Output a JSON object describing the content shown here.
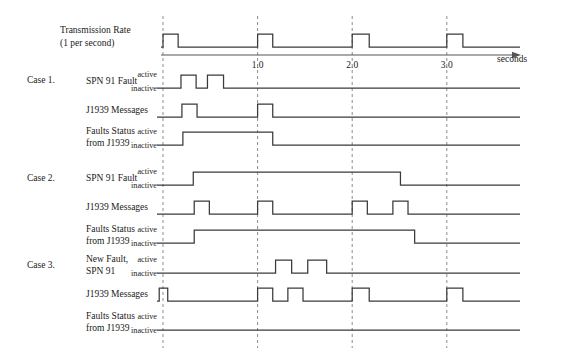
{
  "figure": {
    "title_row": {
      "label_line1": "Transmission Rate",
      "label_line2": "(1 per second)"
    },
    "axis": {
      "unit_label": "seconds",
      "tick_labels": [
        "1.0",
        "2.0",
        "3.0"
      ],
      "tick_times": [
        1.0,
        2.0,
        3.0
      ],
      "time_min": 0.0,
      "time_max": 4.1,
      "gridline_times": [
        0.0,
        1.0,
        2.0,
        3.0
      ]
    },
    "state_labels": {
      "high": "active",
      "low": "inactive"
    },
    "colors": {
      "waveform": "#3a3a3a",
      "gridline": "#8c8c8c",
      "axis": "#555555",
      "text": "#1a1a1a",
      "background": "#ffffff"
    },
    "cases": [
      {
        "case_label": "Case 1.",
        "rows": [
          {
            "label_line1": "SPN 91 Fault",
            "label_line2": "",
            "show_state_labels": true,
            "pulses": [
              [
                0.19,
                0.35
              ],
              [
                0.47,
                0.64
              ]
            ],
            "level_start": 0
          },
          {
            "label_line1": "J1939 Messages",
            "label_line2": "",
            "show_state_labels": false,
            "pulses": [
              [
                0.2,
                0.36
              ],
              [
                1.0,
                1.16
              ]
            ],
            "level_start": 0
          },
          {
            "label_line1": "Faults Status",
            "label_line2": "from J1939",
            "show_state_labels": true,
            "pulses": [
              [
                0.21,
                1.16
              ]
            ],
            "level_start": 0
          }
        ]
      },
      {
        "case_label": "Case 2.",
        "rows": [
          {
            "label_line1": "SPN 91 Fault",
            "label_line2": "",
            "show_state_labels": true,
            "pulses": [
              [
                0.32,
                2.51
              ]
            ],
            "level_start": 0
          },
          {
            "label_line1": "J1939 Messages",
            "label_line2": "",
            "show_state_labels": false,
            "pulses": [
              [
                0.33,
                0.49
              ],
              [
                1.0,
                1.16
              ],
              [
                2.0,
                2.16
              ],
              [
                2.43,
                2.59
              ]
            ],
            "level_start": 0
          },
          {
            "label_line1": "Faults Status",
            "label_line2": "from J1939",
            "show_state_labels": true,
            "pulses": [
              [
                0.33,
                2.66
              ]
            ],
            "level_start": 0
          }
        ]
      },
      {
        "case_label": "Case 3.",
        "rows": [
          {
            "label_line1": "New Fault,",
            "label_line2": "SPN 91",
            "show_state_labels": true,
            "pulses": [
              [
                1.19,
                1.36
              ],
              [
                1.53,
                1.73
              ]
            ],
            "level_start": 0
          },
          {
            "label_line1": "J1939 Messages",
            "label_line2": "",
            "show_state_labels": false,
            "pulses": [
              [
                -0.04,
                0.05
              ],
              [
                1.0,
                1.16
              ],
              [
                1.32,
                1.48
              ],
              [
                2.0,
                2.18
              ],
              [
                3.0,
                3.17
              ]
            ],
            "level_start": 0
          },
          {
            "label_line1": "Faults Status",
            "label_line2": "from J1939",
            "show_state_labels": true,
            "pulses": [],
            "level_start": 0
          }
        ]
      }
    ]
  },
  "chart_data": {
    "type": "line",
    "xlabel": "seconds",
    "ylabel": "",
    "xlim": [
      0.0,
      4.1
    ],
    "grid": true,
    "series": [
      {
        "name": "Transmission Rate (1 per second)",
        "kind": "digital",
        "pulses": [
          [
            0.0,
            0.16
          ],
          [
            1.0,
            1.16
          ],
          [
            2.0,
            2.18
          ],
          [
            3.0,
            3.17
          ]
        ]
      },
      {
        "name": "Case 1 - SPN 91 Fault",
        "kind": "digital",
        "pulses": [
          [
            0.19,
            0.35
          ],
          [
            0.47,
            0.64
          ]
        ]
      },
      {
        "name": "Case 1 - J1939 Messages",
        "kind": "digital",
        "pulses": [
          [
            0.2,
            0.36
          ],
          [
            1.0,
            1.16
          ]
        ]
      },
      {
        "name": "Case 1 - Faults Status from J1939",
        "kind": "digital",
        "pulses": [
          [
            0.21,
            1.16
          ]
        ]
      },
      {
        "name": "Case 2 - SPN 91 Fault",
        "kind": "digital",
        "pulses": [
          [
            0.32,
            2.51
          ]
        ]
      },
      {
        "name": "Case 2 - J1939 Messages",
        "kind": "digital",
        "pulses": [
          [
            0.33,
            0.49
          ],
          [
            1.0,
            1.16
          ],
          [
            2.0,
            2.16
          ],
          [
            2.43,
            2.59
          ]
        ]
      },
      {
        "name": "Case 2 - Faults Status from J1939",
        "kind": "digital",
        "pulses": [
          [
            0.33,
            2.66
          ]
        ]
      },
      {
        "name": "Case 3 - New Fault, SPN 91",
        "kind": "digital",
        "pulses": [
          [
            1.19,
            1.36
          ],
          [
            1.53,
            1.73
          ]
        ]
      },
      {
        "name": "Case 3 - J1939 Messages",
        "kind": "digital",
        "pulses": [
          [
            -0.04,
            0.05
          ],
          [
            1.0,
            1.16
          ],
          [
            1.32,
            1.48
          ],
          [
            2.0,
            2.18
          ],
          [
            3.0,
            3.17
          ]
        ]
      },
      {
        "name": "Case 3 - Faults Status from J1939",
        "kind": "digital",
        "pulses": []
      }
    ]
  }
}
